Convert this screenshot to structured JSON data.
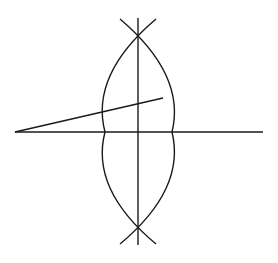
{
  "diagram": {
    "type": "lens-ray-construction",
    "stroke_color": "#1a1a1a",
    "background_color": "#ffffff",
    "elements": {
      "principal_axis": {
        "x1": 15,
        "y1": 132,
        "x2": 263,
        "y2": 132
      },
      "lens_plane": {
        "x1": 138,
        "y1": 18,
        "x2": 138,
        "y2": 245
      },
      "ray": {
        "x1": 15,
        "y1": 132,
        "x2": 163,
        "y2": 98
      },
      "lens_top_vertex": {
        "x": 138,
        "y": 37
      },
      "lens_bottom_vertex": {
        "x": 138,
        "y": 225
      },
      "lens_left_edge_x": 105,
      "lens_right_edge_x": 172
    }
  }
}
